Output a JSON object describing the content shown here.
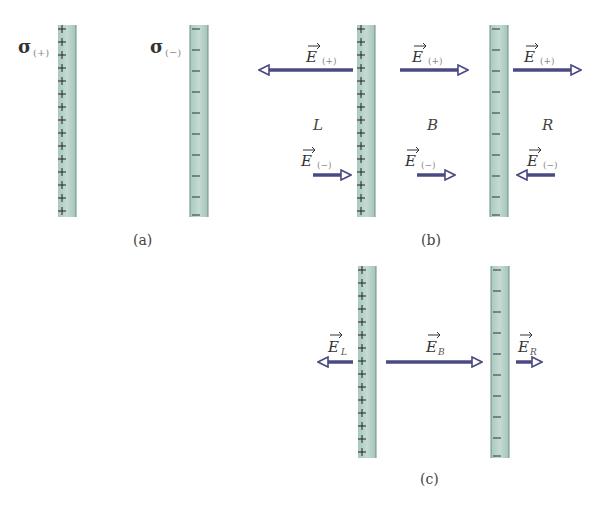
{
  "colors": {
    "plate_fill": "#bcd5cc",
    "plate_edge": "#6f8f86",
    "arrow": "#4a4a82",
    "text": "#333333",
    "sub_text": "#888888"
  },
  "panel_a": {
    "caption": "(a)",
    "plus_plate_label": "σ",
    "plus_plate_sub": "(+)",
    "minus_plate_label": "σ",
    "minus_plate_sub": "(−)"
  },
  "panel_b": {
    "caption": "(b)",
    "regions": {
      "left": "L",
      "between": "B",
      "right": "R"
    },
    "field_symbol": "E",
    "plus_sub": "(+)",
    "minus_sub": "(−)",
    "arrows": [
      {
        "region": "L",
        "source": "(+)",
        "direction": "left"
      },
      {
        "region": "B",
        "source": "(+)",
        "direction": "right"
      },
      {
        "region": "R",
        "source": "(+)",
        "direction": "right"
      },
      {
        "region": "L",
        "source": "(−)",
        "direction": "right"
      },
      {
        "region": "B",
        "source": "(−)",
        "direction": "right"
      },
      {
        "region": "R",
        "source": "(−)",
        "direction": "left"
      }
    ]
  },
  "panel_c": {
    "caption": "(c)",
    "field_symbol": "E",
    "left_sub": "L",
    "between_sub": "B",
    "right_sub": "R",
    "arrows": [
      {
        "label": "E_L",
        "direction": "left"
      },
      {
        "label": "E_B",
        "direction": "right"
      },
      {
        "label": "E_R",
        "direction": "right"
      }
    ]
  }
}
